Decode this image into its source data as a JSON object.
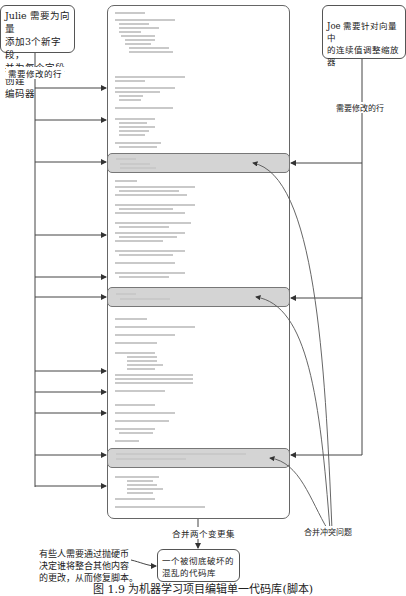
{
  "julie_box": {
    "text_lines": [
      "Julie 需要为向量",
      "添加3个新字段，",
      "并为每个字段创建",
      "编码器"
    ]
  },
  "joe_box": {
    "text_lines": [
      "Joe 需要针对向量中",
      "的连续值调整缩放器"
    ]
  },
  "left_label": "需要修改的行",
  "right_label": "需要修改的行",
  "conflict_label": "合并冲突问题",
  "merge_label": "合并两个变更集",
  "result_box": {
    "text_lines": [
      "一个被彻底破坏的",
      "混乱的代码库"
    ]
  },
  "side_note": {
    "text_lines": [
      "有些人需要通过抛硬币",
      "决定谁将整合其他内容",
      "的更改，从而修复脚本。"
    ]
  },
  "caption": "图 1.9   为机器学习项目编辑单一代码库(脚本)",
  "code_block": {
    "description": "script source code (illegible at this resolution)",
    "conflict_regions": 3
  },
  "colors": {
    "highlight_band": "#d4d4d4",
    "lines": "#444444",
    "code_text": "#c9c9c9"
  }
}
